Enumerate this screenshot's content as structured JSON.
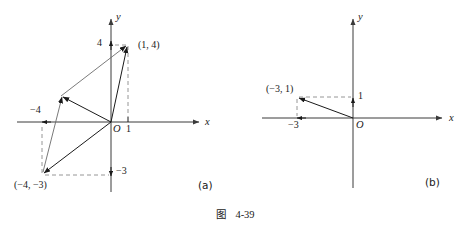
{
  "figure": {
    "caption_cjk": "图",
    "caption_number": "4-39"
  },
  "panel_a": {
    "tag": "(a)",
    "axis_x_label": "x",
    "axis_y_label": "y",
    "origin_label": "O",
    "ticks": {
      "x_positive": "1",
      "x_negative": "−4",
      "y_positive": "4",
      "y_negative": "−3"
    },
    "points": [
      {
        "name": "point-1-4",
        "label": "(1, 4)",
        "x": 1,
        "y": 4
      },
      {
        "name": "point-neg4-neg3",
        "label": "(−4, −3)",
        "x": -4,
        "y": -3
      }
    ],
    "vectors": [
      {
        "name": "vector-to-1-4",
        "from": [
          0,
          0
        ],
        "to": [
          1,
          4
        ]
      },
      {
        "name": "vector-to-neg4-neg3",
        "from": [
          0,
          0
        ],
        "to": [
          -4,
          -3
        ]
      },
      {
        "name": "vector-resultant",
        "from": [
          0,
          0
        ],
        "to": [
          -3,
          1
        ]
      },
      {
        "name": "vector-parallelogram-side-upper",
        "from": [
          -3,
          1
        ],
        "to": [
          1,
          4
        ]
      },
      {
        "name": "vector-parallelogram-side-lower",
        "from": [
          -4,
          -3
        ],
        "to": [
          -3,
          1
        ]
      }
    ]
  },
  "panel_b": {
    "tag": "(b)",
    "axis_x_label": "x",
    "axis_y_label": "y",
    "origin_label": "O",
    "ticks": {
      "x_negative": "−3",
      "y_positive": "1"
    },
    "points": [
      {
        "name": "point-neg3-1",
        "label": "(−3, 1)",
        "x": -3,
        "y": 1
      }
    ],
    "vectors": [
      {
        "name": "vector-to-neg3-1",
        "from": [
          0,
          0
        ],
        "to": [
          -3,
          1
        ]
      }
    ]
  },
  "colors": {
    "ink": "#1a1a1a",
    "axis": "#3a3a3a",
    "dashed": "#8a8a8a"
  }
}
